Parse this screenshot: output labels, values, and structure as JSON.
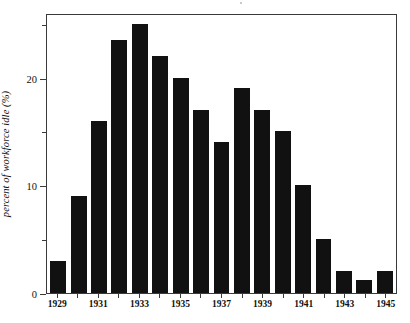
{
  "chart_data": {
    "type": "bar",
    "title": "",
    "subtitle": "",
    "xlabel": "",
    "ylabel": "percent of workforce idle (%)",
    "categories": [
      "1929",
      "1930",
      "1931",
      "1932",
      "1933",
      "1934",
      "1935",
      "1936",
      "1937",
      "1938",
      "1939",
      "1940",
      "1941",
      "1942",
      "1943",
      "1944",
      "1945"
    ],
    "values": [
      3,
      9,
      16,
      23.5,
      25,
      22,
      20,
      17,
      14,
      19,
      17,
      15,
      10,
      5,
      2,
      1.2,
      2
    ],
    "tick_labels_x": [
      "1929",
      "",
      "1931",
      "",
      "1933",
      "",
      "1935",
      "",
      "1937",
      "",
      "1939",
      "",
      "1941",
      "",
      "1943",
      "",
      "1945"
    ],
    "ylim": [
      0,
      26
    ],
    "xlim_categories": 17,
    "y_major_ticks": [
      0,
      10,
      20
    ],
    "y_major_tick_labels": [
      "0",
      "10",
      "20"
    ],
    "y_minor_ticks": [
      5,
      15,
      25
    ],
    "grid": false,
    "legend": false,
    "legend_position": "none",
    "bar_color": "#111111",
    "axis_color": "#3a3a3a",
    "background_color": "#ffffff"
  },
  "figure": {
    "y_axis_title": "percent of workforce idle (%)"
  }
}
